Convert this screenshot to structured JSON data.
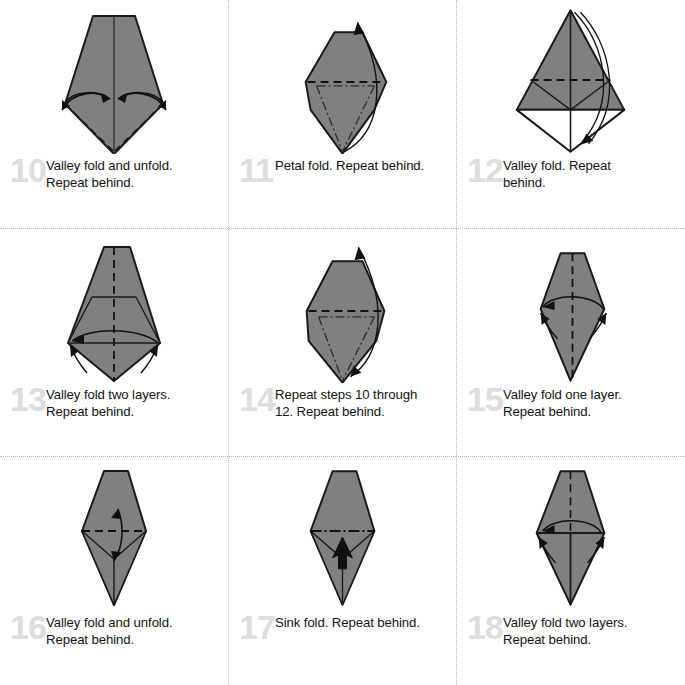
{
  "document": {
    "kind": "origami-instruction-diagram-sheet",
    "columns": 3,
    "rows": 3,
    "colors": {
      "paper_gray": "#808080",
      "paper_white": "#ffffff",
      "outline": "#1a1a1a",
      "step_number": "#dddddd",
      "caption_text": "#141414",
      "divider": "#b9b9b9",
      "background": "#ffffff"
    }
  },
  "steps": [
    {
      "number": "10",
      "lines": [
        "Valley fold and unfold.",
        "Repeat behind."
      ],
      "figure": "kite-with-two-valley-fold-and-unfold-arrows",
      "fold_lines": [
        "dashed-left-diagonal",
        "dashed-right-diagonal",
        "solid-center-vertical"
      ],
      "arrows": [
        "double-head-curved-left",
        "double-head-curved-right"
      ]
    },
    {
      "number": "11",
      "lines": [
        "Petal fold. Repeat behind."
      ],
      "figure": "pentagon-kite-with-petal-fold-arrow",
      "fold_lines": [
        "dashed-horizontal",
        "dash-dot-left-diagonal",
        "dash-dot-right-diagonal"
      ],
      "arrows": [
        "curved-up-arrow-right-side"
      ]
    },
    {
      "number": "12",
      "lines": [
        "Valley fold. Repeat",
        "behind."
      ],
      "figure": "gray-triangle-over-white-diamond",
      "fold_lines": [
        "dashed-horizontal",
        "solid-center-vertical",
        "solid-side-diagonals"
      ],
      "arrows": [
        "curved-down-arrow-right-side"
      ]
    },
    {
      "number": "13",
      "lines": [
        "Valley fold two layers.",
        "Repeat behind."
      ],
      "figure": "kite-with-white-side-flaps",
      "fold_lines": [
        "dashed-center-vertical"
      ],
      "arrows": [
        "curved-left-arrow",
        "small-left-flap-arrow",
        "small-right-flap-arrow"
      ]
    },
    {
      "number": "14",
      "lines": [
        "Repeat steps 10 through",
        "12. Repeat behind."
      ],
      "figure": "pentagon-kite-with-repeat-arrow",
      "fold_lines": [
        "dashed-horizontal",
        "dash-dot-left-diagonal",
        "dash-dot-right-diagonal"
      ],
      "arrows": [
        "double-head-curved-repeat-arrow"
      ]
    },
    {
      "number": "15",
      "lines": [
        "Valley fold one layer.",
        "Repeat behind."
      ],
      "figure": "narrow-hexagon-with-valley-arrow",
      "fold_lines": [
        "dashed-center-vertical"
      ],
      "arrows": [
        "curved-left-arrow",
        "small-left-arrow",
        "small-right-arrow"
      ]
    },
    {
      "number": "16",
      "lines": [
        "Valley fold and unfold.",
        "Repeat behind."
      ],
      "figure": "narrow-diamond-with-vertical-fold-unfold-arrow",
      "fold_lines": [
        "dashed-horizontal",
        "solid-center-vertical"
      ],
      "arrows": [
        "double-head-vertical-arrow"
      ]
    },
    {
      "number": "17",
      "lines": [
        "Sink fold. Repeat behind."
      ],
      "figure": "narrow-diamond-with-sink-arrow",
      "fold_lines": [
        "dash-dot-horizontal",
        "solid-center-vertical"
      ],
      "arrows": [
        "hollow-sink-arrow-up"
      ]
    },
    {
      "number": "18",
      "lines": [
        "Valley fold two layers.",
        "Repeat behind."
      ],
      "figure": "narrow-diamond-with-two-layer-valley-arrow",
      "fold_lines": [
        "dashed-center-vertical",
        "solid-horizontal",
        "solid-center-vertical"
      ],
      "arrows": [
        "curved-left-arrow",
        "small-left-arrow",
        "small-right-arrow"
      ]
    }
  ]
}
